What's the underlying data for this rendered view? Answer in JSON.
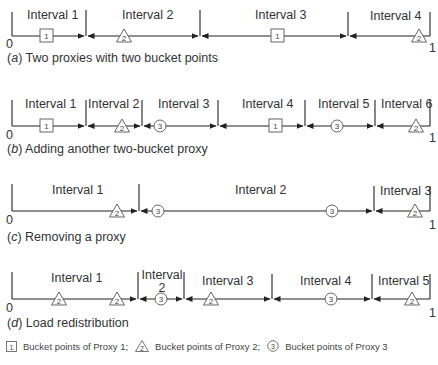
{
  "rows": [
    {
      "id": "a",
      "caption_letter": "a",
      "caption_text": " Two proxies with two bucket points",
      "intervals": [
        "Interval 1",
        "Interval 2",
        "Interval 3",
        "Interval 4"
      ],
      "start_label": "0",
      "end_label": "1",
      "markers": [
        {
          "proxy": 1,
          "shape": "square",
          "label": "1"
        },
        {
          "proxy": 2,
          "shape": "triangle",
          "label": "2"
        },
        {
          "proxy": 1,
          "shape": "square",
          "label": "1"
        },
        {
          "proxy": 2,
          "shape": "triangle",
          "label": "2"
        }
      ]
    },
    {
      "id": "b",
      "caption_letter": "b",
      "caption_text": " Adding another two-bucket proxy",
      "intervals": [
        "Interval 1",
        "Interval 2",
        "Interval 3",
        "Interval 4",
        "Interval 5",
        "Interval 6"
      ],
      "start_label": "0",
      "end_label": "1",
      "markers": [
        {
          "proxy": 1,
          "shape": "square",
          "label": "1"
        },
        {
          "proxy": 2,
          "shape": "triangle",
          "label": "2"
        },
        {
          "proxy": 3,
          "shape": "circle",
          "label": "3"
        },
        {
          "proxy": 1,
          "shape": "square",
          "label": "1"
        },
        {
          "proxy": 3,
          "shape": "circle",
          "label": "3"
        },
        {
          "proxy": 2,
          "shape": "triangle",
          "label": "2"
        }
      ]
    },
    {
      "id": "c",
      "caption_letter": "c",
      "caption_text": " Removing a proxy",
      "intervals": [
        "Interval 1",
        "Interval 2",
        "Interval 3"
      ],
      "start_label": "0",
      "end_label": "1",
      "markers": [
        {
          "proxy": 2,
          "shape": "triangle",
          "label": "2"
        },
        {
          "proxy": 3,
          "shape": "circle",
          "label": "3"
        },
        {
          "proxy": 3,
          "shape": "circle",
          "label": "3"
        },
        {
          "proxy": 2,
          "shape": "triangle",
          "label": "2"
        }
      ]
    },
    {
      "id": "d",
      "caption_letter": "d",
      "caption_text": " Load redistribution",
      "intervals": [
        "Interval 1",
        "Interval 2",
        "Interval 3",
        "Interval 4",
        "Interval 5"
      ],
      "interval_2_lines": [
        "Interval",
        "2"
      ],
      "start_label": "0",
      "end_label": "1",
      "markers": [
        {
          "proxy": 2,
          "shape": "triangle",
          "label": "2"
        },
        {
          "proxy": 2,
          "shape": "triangle",
          "label": "2"
        },
        {
          "proxy": 3,
          "shape": "circle",
          "label": "3"
        },
        {
          "proxy": 2,
          "shape": "triangle",
          "label": "2"
        },
        {
          "proxy": 3,
          "shape": "circle",
          "label": "3"
        },
        {
          "proxy": 2,
          "shape": "triangle",
          "label": "2"
        }
      ]
    }
  ],
  "legend": {
    "items": [
      {
        "symbol": "square",
        "number": "1",
        "text": "Bucket points of Proxy 1;"
      },
      {
        "symbol": "triangle",
        "number": "2",
        "text": "Bucket points of Proxy 2;"
      },
      {
        "symbol": "circle",
        "number": "3",
        "text": "Bucket points of Proxy 3"
      }
    ]
  },
  "colors": {
    "line": "#222222",
    "text": "#333333",
    "marker_stroke": "#555555",
    "background": "#ffffff"
  }
}
